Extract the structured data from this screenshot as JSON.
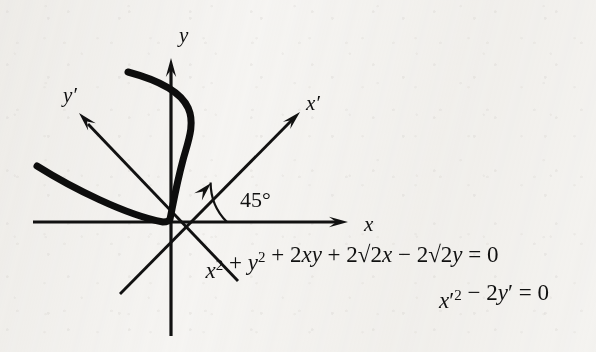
{
  "figure": {
    "kind": "math-diagram",
    "background_color": "#f6f5f3",
    "ink_color": "#111111",
    "width": 596,
    "height": 352
  },
  "axes": {
    "x": {
      "label": "x",
      "label_x": 364,
      "label_y": 231,
      "line": {
        "x1": 33,
        "y1": 222,
        "x2": 340,
        "y2": 222
      },
      "arrow_tip": {
        "x": 348,
        "y": 222
      },
      "arrow_angle_deg": 0
    },
    "y": {
      "label": "y",
      "label_x": 179,
      "label_y": 42,
      "line": {
        "x1": 171,
        "y1": 336,
        "x2": 171,
        "y2": 68
      },
      "arrow_tip": {
        "x": 171,
        "y": 58
      },
      "arrow_angle_deg": -90
    },
    "x_prime": {
      "label": "x′",
      "label_x": 306,
      "label_y": 110,
      "line": {
        "x1": 120,
        "y1": 294,
        "x2": 292,
        "y2": 120
      },
      "arrow_tip": {
        "x": 300,
        "y": 112
      },
      "arrow_angle_deg": -45
    },
    "y_prime": {
      "label": "y′",
      "label_x": 63,
      "label_y": 102,
      "line": {
        "x1": 238,
        "y1": 281,
        "x2": 88,
        "y2": 124
      },
      "arrow_tip": {
        "x": 79,
        "y": 113
      },
      "arrow_angle_deg": -133
    }
  },
  "angle_marker": {
    "label": "45°",
    "label_x": 240,
    "label_y": 207,
    "vertex": {
      "x": 171,
      "y": 222
    },
    "radius": 56,
    "start_deg": 0,
    "end_deg": 45,
    "arrow_tip": {
      "x": 211,
      "y": 183
    },
    "arrow_angle_deg": -47
  },
  "curve": {
    "name": "parabola-x-prime-squared-equals-2-y-prime",
    "stroke_width": 7,
    "path": "M 37 166 C 72 188 126 215 163 222 C 166 222 169 221 170 219 C 172 210 176 186 183 160 C 192 127 210 94 128 72",
    "branch_upper_end": {
      "x": 128,
      "y": 72
    },
    "branch_left_end": {
      "x": 37,
      "y": 166
    },
    "vertex": {
      "x": 171,
      "y": 222
    }
  },
  "equations": [
    {
      "id": "equation-original",
      "x": 352,
      "y": 278,
      "anchor": "middle",
      "parts": [
        {
          "t": "x",
          "style": "italic"
        },
        {
          "t": "2",
          "style": "sup"
        },
        {
          "t": " + ",
          "style": "roman"
        },
        {
          "t": "y",
          "style": "italic"
        },
        {
          "t": "2",
          "style": "sup"
        },
        {
          "t": " + 2",
          "style": "roman"
        },
        {
          "t": "xy",
          "style": "italic"
        },
        {
          "t": " + 2",
          "style": "roman"
        },
        {
          "t": "√2",
          "style": "roman"
        },
        {
          "t": "x",
          "style": "italic"
        },
        {
          "t": " − 2",
          "style": "roman"
        },
        {
          "t": "√2",
          "style": "roman"
        },
        {
          "t": "y",
          "style": "italic"
        },
        {
          "t": " = 0",
          "style": "roman"
        }
      ],
      "plain": "x² + y² + 2xy + 2√2x − 2√2y = 0"
    },
    {
      "id": "equation-rotated",
      "x": 494,
      "y": 308,
      "anchor": "middle",
      "parts": [
        {
          "t": "x",
          "style": "italic"
        },
        {
          "t": "′",
          "style": "roman"
        },
        {
          "t": "2",
          "style": "sup"
        },
        {
          "t": " − 2",
          "style": "roman"
        },
        {
          "t": "y",
          "style": "italic"
        },
        {
          "t": "′",
          "style": "roman"
        },
        {
          "t": " = 0",
          "style": "roman"
        }
      ],
      "plain": "x′2 − 2y′ = 0"
    }
  ]
}
